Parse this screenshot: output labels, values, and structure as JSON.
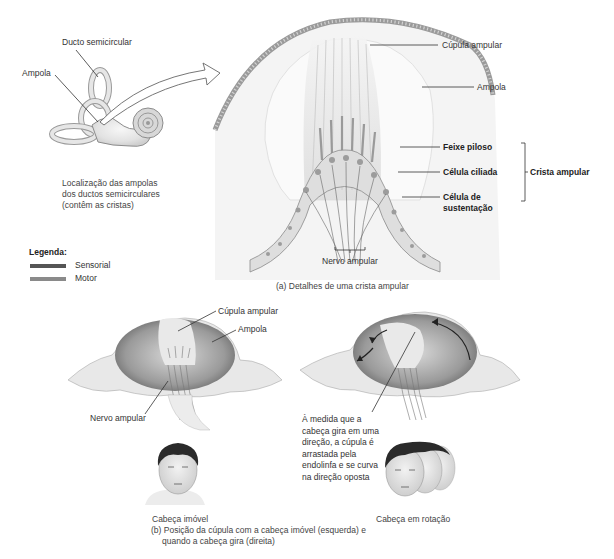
{
  "inner_ear_overview": {
    "labels": {
      "semicircular_duct": "Ducto semicircular",
      "ampulla": "Ampola"
    },
    "caption_lines": [
      "Localização das ampolas",
      "dos ductos semicirculares",
      "(contêm as cristas)"
    ]
  },
  "legend": {
    "title": "Legenda:",
    "items": [
      {
        "label": "Sensorial",
        "color": "#555555"
      },
      {
        "label": "Motor",
        "color": "#8a8a8a"
      }
    ]
  },
  "panel_a": {
    "labels": {
      "cupula": "Cúpula ampular",
      "ampulla": "Ampola",
      "hair_bundle": "Feixe piloso",
      "hair_cell": "Célula ciliada",
      "supporting_cell_line1": "Célula de",
      "supporting_cell_line2": "sustentação",
      "crista": "Crista ampular",
      "nerve": "Nervo ampular"
    },
    "caption": "(a) Detalhes de uma crista ampular"
  },
  "panel_b": {
    "left": {
      "labels": {
        "cupula": "Cúpula ampular",
        "ampulla": "Ampola",
        "nerve": "Nervo ampular"
      },
      "head_caption": "Cabeça imóvel"
    },
    "right": {
      "description_lines": [
        "À medida que a",
        "cabeça gira em uma",
        "direção, a cúpula é",
        "arrastada pela",
        "endolinfa e se curva",
        "na direção oposta"
      ],
      "head_caption": "Cabeça em rotação"
    },
    "caption_lines": [
      "(b) Posição da cúpula com a cabeça imóvel (esquerda) e",
      "quando a cabeça gira (direita)"
    ]
  }
}
